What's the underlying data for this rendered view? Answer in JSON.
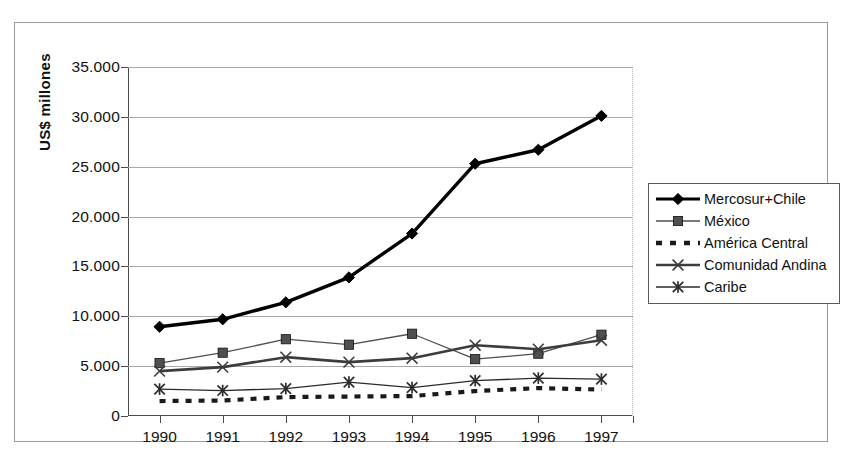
{
  "figure": {
    "cropped_title_fragment": "",
    "yaxis_title": "US$ millones"
  },
  "legend": {
    "position": "right",
    "entries": [
      {
        "label": "Mercosur+Chile",
        "marker": "diamond-marker",
        "color": "#000000",
        "line": "solid-thick"
      },
      {
        "label": "México",
        "marker": "square-marker",
        "color": "#4f4f4f",
        "line": "solid-thin"
      },
      {
        "label": "América Central",
        "marker": "none",
        "color": "#1a1a1a",
        "line": "dotted-square"
      },
      {
        "label": "Comunidad Andina",
        "marker": "x-marker",
        "color": "#3c3c3c",
        "line": "solid-thick"
      },
      {
        "label": "Caribe",
        "marker": "asterisk-marker",
        "color": "#2b2b2b",
        "line": "solid-thin"
      }
    ]
  },
  "axes": {
    "y_ticks": [
      "35.000",
      "30.000",
      "25.000",
      "20.000",
      "15.000",
      "10.000",
      "5.000",
      "0"
    ],
    "x_ticks": [
      "1990",
      "1991",
      "1992",
      "1993",
      "1994",
      "1995",
      "1996",
      "1997"
    ]
  },
  "chart_data": {
    "type": "line",
    "title": "",
    "xlabel": "",
    "ylabel": "US$ millones",
    "x": [
      "1990",
      "1991",
      "1992",
      "1993",
      "1994",
      "1995",
      "1996",
      "1997"
    ],
    "ylim": [
      0,
      35000
    ],
    "ytick_values": [
      0,
      5000,
      10000,
      15000,
      20000,
      25000,
      30000,
      35000
    ],
    "ytick_labels": [
      "0",
      "5.000",
      "10.000",
      "15.000",
      "20.000",
      "25.000",
      "30.000",
      "35.000"
    ],
    "grid": "horizontal",
    "legend_position": "right",
    "units": "US$ millones",
    "series": [
      {
        "name": "Mercosur+Chile",
        "values": [
          8950,
          9700,
          11400,
          13900,
          18300,
          25300,
          26700,
          30100
        ],
        "marker": "diamond",
        "color": "#000000",
        "linestyle": "solid",
        "linewidth": "thick"
      },
      {
        "name": "México",
        "values": [
          5300,
          6350,
          7700,
          7150,
          8250,
          5700,
          6250,
          8150
        ],
        "marker": "square",
        "color": "#4f4f4f",
        "linestyle": "solid",
        "linewidth": "thin"
      },
      {
        "name": "América Central",
        "values": [
          1500,
          1550,
          1900,
          1950,
          2000,
          2500,
          2800,
          2650
        ],
        "marker": "none",
        "color": "#1a1a1a",
        "linestyle": "dotted",
        "linewidth": "thick"
      },
      {
        "name": "Comunidad Andina",
        "values": [
          4500,
          4900,
          5900,
          5400,
          5800,
          7100,
          6700,
          7600
        ],
        "marker": "x",
        "color": "#3c3c3c",
        "linestyle": "solid",
        "linewidth": "thick"
      },
      {
        "name": "Caribe",
        "values": [
          2700,
          2550,
          2750,
          3400,
          2850,
          3550,
          3800,
          3700
        ],
        "marker": "asterisk",
        "color": "#2b2b2b",
        "linestyle": "solid",
        "linewidth": "thin"
      }
    ]
  }
}
